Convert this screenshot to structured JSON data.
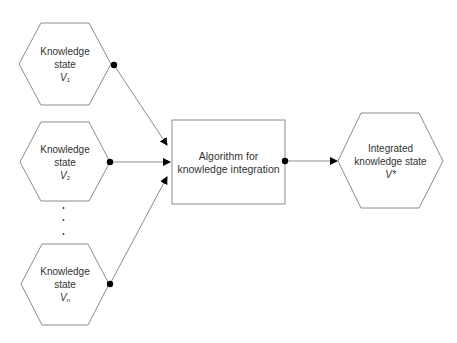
{
  "colors": {
    "stroke": "#8c8c8c",
    "node_fill": "#ffffff",
    "dot": "#000000",
    "arrow": "#000000",
    "text": "#333333"
  },
  "nodes": {
    "v1": {
      "line1": "Knowledge",
      "line2": "state",
      "var": "V",
      "sub": "1"
    },
    "v2": {
      "line1": "Knowledge",
      "line2": "state",
      "var": "V",
      "sub": "2"
    },
    "ellipsis": ".\n.\n.",
    "vn": {
      "line1": "Knowledge",
      "line2": "state",
      "var": "V",
      "sub": "n"
    },
    "algorithm": {
      "line1": "Algorithm for",
      "line2": "knowledge integration"
    },
    "output": {
      "line1": "Integrated",
      "line2": "knowledge state",
      "var": "V*"
    }
  }
}
